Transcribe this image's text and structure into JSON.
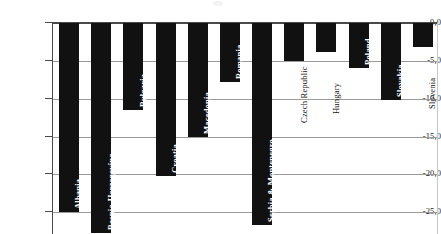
{
  "chart": {
    "title": "",
    "xlabel": "",
    "ylabel": "",
    "axis": {
      "y_ticks": [
        "0,0",
        "-5,0",
        "-10,0",
        "-15,0",
        "-20,0",
        "-25,0"
      ],
      "y_tick_values": [
        0,
        -5,
        -10,
        -15,
        -20,
        -25
      ],
      "ylim_top": 0,
      "ylim_bottom": -28,
      "grid": "horizontal"
    },
    "colors": {
      "bar": "#111111",
      "grid": "#9a9a9a",
      "axis": "#4a4a4a",
      "background": "#ffffff",
      "label_inside": "#ffffff",
      "label_outside": "#111111"
    }
  },
  "chart_data": {
    "type": "bar",
    "title": "",
    "xlabel": "",
    "ylabel": "",
    "ylim": [
      -28,
      0
    ],
    "grid": true,
    "legend": "none",
    "orientation": "vertical",
    "categories": [
      "Albania",
      "Bosnia-Herzegovina",
      "Bulgaria",
      "Croatia",
      "Macedonia",
      "Romania",
      "Serbia & Montenegro",
      "Czech Republic",
      "Hungary",
      "Poland",
      "Slovakia",
      "Slovenia"
    ],
    "values": [
      -25.0,
      -27.7,
      -11.5,
      -20.2,
      -15.0,
      -7.8,
      -26.7,
      -5.0,
      -3.8,
      -6.0,
      -10.2,
      -3.2
    ],
    "tick_labels": [
      "0,0",
      "-5,0",
      "-10,0",
      "-15,0",
      "-20,0",
      "-25,0"
    ],
    "label_placement": [
      "inside",
      "inside",
      "inside",
      "inside",
      "inside",
      "inside",
      "inside",
      "outside",
      "outside",
      "inside",
      "inside",
      "outside"
    ]
  }
}
